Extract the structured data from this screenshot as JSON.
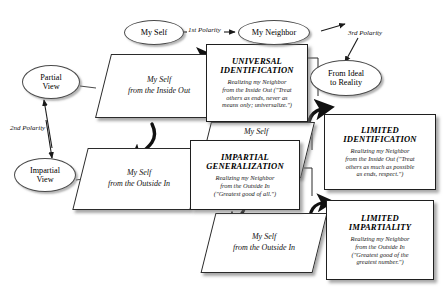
{
  "diagram": {
    "background": "#ffffff",
    "ellipses": [
      {
        "id": "my-self",
        "lines": [
          "My Self"
        ]
      },
      {
        "id": "my-neighbor",
        "lines": [
          "My Neighbor"
        ]
      },
      {
        "id": "partial-view",
        "lines": [
          "Partial",
          "View"
        ]
      },
      {
        "id": "impartial-view",
        "lines": [
          "Impartial",
          "View"
        ]
      },
      {
        "id": "from-ideal-to-reality",
        "lines": [
          "From Ideal",
          "to Reality"
        ]
      }
    ],
    "polarities": [
      {
        "id": "first",
        "label": "1st Polarity"
      },
      {
        "id": "second",
        "label": "2nd Polarity"
      },
      {
        "id": "third",
        "label": "3rd Polarity"
      }
    ],
    "parallelograms": [
      {
        "id": "self-inside-out-top",
        "lines": [
          "My Self",
          "from the Inside Out"
        ]
      },
      {
        "id": "self-outside-in-left",
        "lines": [
          "My Self",
          "from the Outside In"
        ]
      },
      {
        "id": "self-inside-out-mid",
        "lines": [
          "My Self",
          "Out"
        ]
      },
      {
        "id": "self-outside-in-bottom",
        "lines": [
          "My Self",
          "from the Outside In"
        ]
      }
    ],
    "concept_boxes": [
      {
        "id": "universal-identification",
        "title": [
          "UNIVERSAL",
          "IDENTIFICATION"
        ],
        "body": [
          "Realizing my Neighbor",
          "from the Inside Out (\"Treat",
          "others as ends, never as",
          "means only; universalize.\")"
        ]
      },
      {
        "id": "impartial-generalization",
        "title": [
          "IMPARTIAL",
          "GENERALIZATION"
        ],
        "body": [
          "Realizing my Neighbor",
          "from the Outside In",
          "(\"Greatest good of all.\")"
        ]
      },
      {
        "id": "limited-identification",
        "title": [
          "LIMITED",
          "IDENTIFICATION"
        ],
        "body": [
          "Realizing my Neighbor",
          "from the Inside Out (\"Treat",
          "others as much as possible",
          "as ends, respect.\")"
        ]
      },
      {
        "id": "limited-impartiality",
        "title": [
          "LIMITED",
          "IMPARTIALITY"
        ],
        "body": [
          "Realizing my Neighbor",
          "from the Outside In",
          "(\"Greatest good of the",
          "greatest number.\")"
        ]
      }
    ]
  }
}
